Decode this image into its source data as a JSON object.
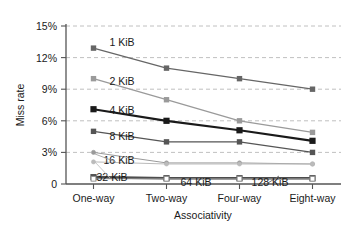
{
  "chart_data": {
    "type": "line",
    "title": "",
    "xlabel": "Associativity",
    "ylabel": "Miss rate",
    "categories": [
      "One-way",
      "Two-way",
      "Four-way",
      "Eight-way"
    ],
    "ylim": [
      0,
      15
    ],
    "ytick_labels": [
      "0",
      "3%",
      "6%",
      "9%",
      "12%",
      "15%"
    ],
    "ytick_values": [
      0,
      3,
      6,
      9,
      12,
      15
    ],
    "grid": "horizontal-dashed",
    "legend_position": "inline-annotations",
    "series": [
      {
        "name": "1 KiB",
        "label": "1 KiB",
        "values": [
          12.9,
          11.0,
          10.0,
          9.0
        ],
        "color": "#666666",
        "marker": "square",
        "width": 1.3
      },
      {
        "name": "2 KiB",
        "label": "2 KiB",
        "values": [
          10.0,
          8.0,
          6.0,
          4.9
        ],
        "color": "#9a9a9a",
        "marker": "square",
        "width": 1.3
      },
      {
        "name": "4 KiB",
        "label": "4 KiB",
        "values": [
          7.1,
          6.0,
          5.1,
          4.1
        ],
        "color": "#1a1a1a",
        "marker": "square",
        "width": 2.2
      },
      {
        "name": "8 KiB",
        "label": "8 KiB",
        "values": [
          5.0,
          4.0,
          4.0,
          3.0
        ],
        "color": "#555555",
        "marker": "square",
        "width": 1.3
      },
      {
        "name": "16 KiB",
        "label": "16 KiB",
        "values": [
          3.0,
          2.0,
          2.0,
          1.9
        ],
        "color": "#9a9a9a",
        "marker": "circle",
        "width": 1.0
      },
      {
        "name": "32 KiB",
        "label": "32 KiB",
        "values": [
          2.1,
          1.9,
          1.9,
          1.9
        ],
        "color": "#bbbbbb",
        "marker": "circle",
        "width": 1.0
      },
      {
        "name": "64 KiB",
        "label": "64 KiB",
        "values": [
          0.65,
          0.55,
          0.55,
          0.55
        ],
        "color": "#4d4d4d",
        "marker": "square",
        "width": 2.6
      },
      {
        "name": "128 KiB",
        "label": "128 KiB",
        "values": [
          0.5,
          0.5,
          0.5,
          0.5
        ],
        "color": "#888888",
        "marker": "open-square",
        "width": 1.0
      }
    ],
    "annotations": [
      {
        "text": "1 KiB",
        "x": 122,
        "y": 46
      },
      {
        "text": "2 KiB",
        "x": 122,
        "y": 85
      },
      {
        "text": "4 KiB",
        "x": 122,
        "y": 114
      },
      {
        "text": "8 KiB",
        "x": 122,
        "y": 140
      },
      {
        "text": "16 KiB",
        "x": 119,
        "y": 164
      },
      {
        "text": "32 KiB",
        "x": 112,
        "y": 181
      },
      {
        "text": "64 KiB",
        "x": 196,
        "y": 186
      },
      {
        "text": "128 KiB",
        "x": 270,
        "y": 186
      }
    ]
  },
  "axes": {
    "y_label": "Miss rate",
    "x_label": "Associativity",
    "y_ticks": [
      "15%",
      "12%",
      "9%",
      "6%",
      "3%",
      "0"
    ],
    "x_ticks": [
      "One-way",
      "Two-way",
      "Four-way",
      "Eight-way"
    ]
  }
}
